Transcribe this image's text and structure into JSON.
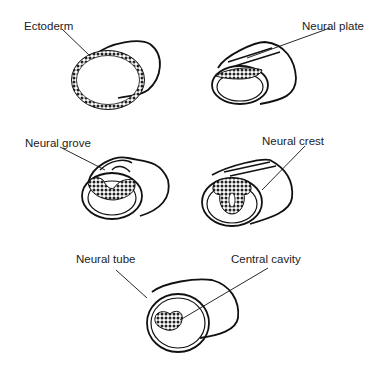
{
  "stages": [
    {
      "id": "ectoderm",
      "label": "Ectoderm"
    },
    {
      "id": "neural-plate",
      "label": "Neural plate"
    },
    {
      "id": "neural-groove",
      "label": "Neural grove"
    },
    {
      "id": "neural-crest",
      "label": "Neural crest"
    },
    {
      "id": "neural-tube",
      "label": "Neural tube"
    },
    {
      "id": "central-cavity",
      "label": "Central cavity"
    }
  ],
  "colors": {
    "ink": "#111111",
    "background": "#ffffff"
  }
}
